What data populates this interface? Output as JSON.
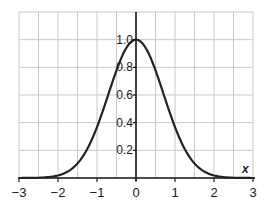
{
  "chart_data": {
    "type": "line",
    "title": "",
    "xlabel": "x",
    "ylabel": "",
    "xlim": [
      -3,
      3
    ],
    "ylim": [
      0,
      1.2
    ],
    "grid": true,
    "grid_x_step": 0.5,
    "grid_y_step": 0.2,
    "x_ticks": [
      "−3",
      "−2",
      "−1",
      "0",
      "1",
      "2",
      "3"
    ],
    "x_tick_values": [
      -3,
      -2,
      -1,
      0,
      1,
      2,
      3
    ],
    "y_ticks": [
      "0.2",
      "0.4",
      "0.6",
      "0.8",
      "1.0"
    ],
    "y_tick_values": [
      0.2,
      0.4,
      0.6,
      0.8,
      1.0
    ],
    "legend": null,
    "series": [
      {
        "name": "y = e^(−x²)",
        "x": [
          -3,
          -2.5,
          -2,
          -1.5,
          -1,
          -0.5,
          0,
          0.5,
          1,
          1.5,
          2,
          2.5,
          3
        ],
        "values": [
          0.0001,
          0.002,
          0.018,
          0.105,
          0.368,
          0.779,
          1.0,
          0.779,
          0.368,
          0.105,
          0.018,
          0.002,
          0.0001
        ]
      }
    ],
    "colors": {
      "curve": "#222222",
      "grid": "#c8c8c8",
      "axis": "#1a1a1a"
    }
  }
}
